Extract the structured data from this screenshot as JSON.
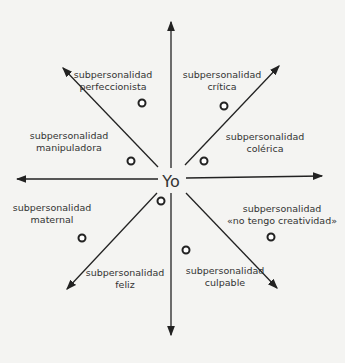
{
  "diagram": {
    "center_label": "Yo",
    "subpersonalities": [
      {
        "line1": "subpersonalidad",
        "line2": "perfeccionista"
      },
      {
        "line1": "subpersonalidad",
        "line2": "crítica"
      },
      {
        "line1": "subpersonalidad",
        "line2": "manipuladora"
      },
      {
        "line1": "subpersonalidad",
        "line2": "colérica"
      },
      {
        "line1": "subpersonalidad",
        "line2": "maternal"
      },
      {
        "line1": "subpersonalidad",
        "line2": "«no tengo creatividad»"
      },
      {
        "line1": "subpersonalidad",
        "line2": "feliz"
      },
      {
        "line1": "subpersonalidad",
        "line2": "culpable"
      }
    ],
    "arrow_count": 8,
    "colors": {
      "ink": "#222222",
      "paper": "#f4f4f2",
      "bleed_through": "#dcdcd8"
    }
  }
}
